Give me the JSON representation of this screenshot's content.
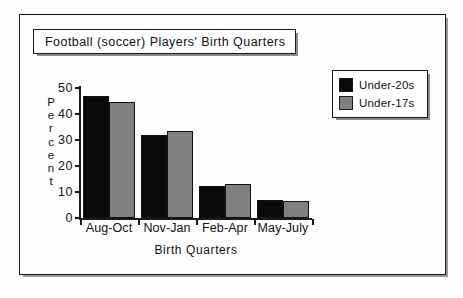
{
  "figure": {
    "title": "Football  (soccer)  Players'  Birth  Quarters",
    "background_color": "#fdfdfd",
    "frame_color": "#1a1a1a"
  },
  "legend": {
    "position": "top-right",
    "entries": [
      {
        "label": "Under-20s",
        "color": "#0a0a0a",
        "swatch_name": "legend-swatch-under-20s"
      },
      {
        "label": "Under-17s",
        "color": "#808080",
        "swatch_name": "legend-swatch-under-17s"
      }
    ]
  },
  "axes": {
    "y_title_letters": [
      "P",
      "e",
      "r",
      "c",
      "e",
      "n",
      "t"
    ],
    "y_title": "Percent",
    "x_title": "Birth  Quarters",
    "y_ticks": [
      0,
      10,
      20,
      30,
      40,
      50
    ]
  },
  "chart_data": {
    "type": "bar",
    "title": "Football  (soccer)  Players'  Birth  Quarters",
    "xlabel": "Birth  Quarters",
    "ylabel": "Percent",
    "categories": [
      "Aug-Oct",
      "Nov-Jan",
      "Feb-Apr",
      "May-July"
    ],
    "series": [
      {
        "name": "Under-20s",
        "color": "#0a0a0a",
        "values": [
          47,
          32,
          12.5,
          7
        ]
      },
      {
        "name": "Under-17s",
        "color": "#808080",
        "values": [
          44.5,
          33.5,
          13,
          6.5
        ]
      }
    ],
    "ylim": [
      0,
      50
    ],
    "ytick_step": 10,
    "grid": false,
    "legend_position": "top-right"
  }
}
